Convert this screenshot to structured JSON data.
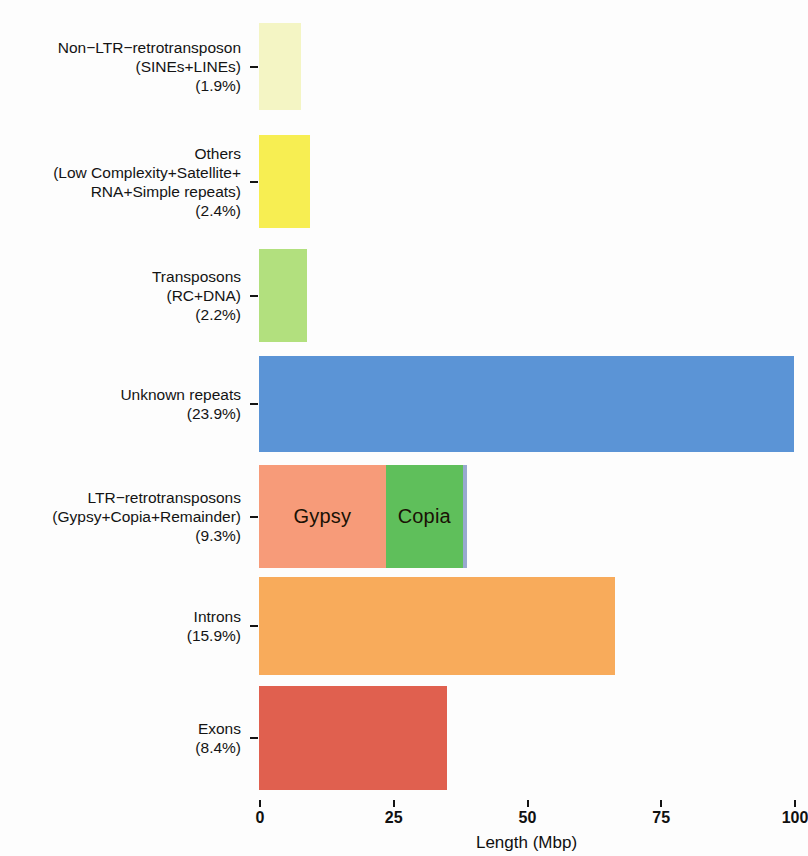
{
  "chart_data": {
    "type": "bar",
    "orientation": "horizontal",
    "stacked": true,
    "title": "",
    "xlabel": "Length (Mbp)",
    "ylabel": "",
    "xlim": [
      0,
      100
    ],
    "xticks": [
      0,
      25,
      50,
      75,
      100
    ],
    "xtick_labels": [
      "0",
      "25",
      "50",
      "75",
      "100"
    ],
    "grid": false,
    "legend": "none",
    "categories": [
      "Non−LTR−retrotransposon\n(SINEs+LINEs)\n(1.9%)",
      "Others\n(Low Complexity+Satellite+\nRNA+Simple repeats)\n(2.4%)",
      "Transposons\n(RC+DNA)\n(2.2%)",
      "Unknown repeats\n(23.9%)",
      "LTR−retrotransposons\n(Gypsy+Copia+Remainder)\n(9.3%)",
      "Introns\n(15.9%)",
      "Exons\n(8.4%)"
    ],
    "values": [
      7.9,
      9.5,
      9.0,
      100.0,
      38.9,
      66.5,
      35.1
    ],
    "percent_labels": [
      "1.9%",
      "2.4%",
      "2.2%",
      "23.9%",
      "9.3%",
      "15.9%",
      "8.4%"
    ],
    "bars": [
      {
        "name": "Non-LTR-retrotransposon",
        "label_lines": [
          "Non−LTR−retrotransposon",
          "(SINEs+LINEs)",
          "(1.9%)"
        ],
        "percent": "1.9%",
        "total": 7.9,
        "segments": [
          {
            "name": "Non-LTR-retrotransposon",
            "value": 7.9,
            "color": "#f4f5c4",
            "label": ""
          }
        ]
      },
      {
        "name": "Others",
        "label_lines": [
          "Others",
          "(Low Complexity+Satellite+",
          "RNA+Simple repeats)",
          "(2.4%)"
        ],
        "percent": "2.4%",
        "total": 9.5,
        "segments": [
          {
            "name": "Others",
            "value": 9.5,
            "color": "#f7ee52",
            "label": ""
          }
        ]
      },
      {
        "name": "Transposons",
        "label_lines": [
          "Transposons",
          "(RC+DNA)",
          "(2.2%)"
        ],
        "percent": "2.2%",
        "total": 9.0,
        "segments": [
          {
            "name": "Transposons",
            "value": 9.0,
            "color": "#b2e07e",
            "label": ""
          }
        ]
      },
      {
        "name": "Unknown repeats",
        "label_lines": [
          "Unknown repeats",
          "(23.9%)"
        ],
        "percent": "23.9%",
        "total": 100.0,
        "segments": [
          {
            "name": "Unknown repeats",
            "value": 100.0,
            "color": "#5b94d6",
            "label": ""
          }
        ]
      },
      {
        "name": "LTR-retrotransposons",
        "label_lines": [
          "LTR−retrotransposons",
          "(Gypsy+Copia+Remainder)",
          "(9.3%)"
        ],
        "percent": "9.3%",
        "total": 38.9,
        "segments": [
          {
            "name": "Gypsy",
            "value": 23.7,
            "color": "#f79b79",
            "label": "Gypsy"
          },
          {
            "name": "Copia",
            "value": 14.4,
            "color": "#5fbf5b",
            "label": "Copia"
          },
          {
            "name": "Remainder",
            "value": 0.8,
            "color": "#98a9cf",
            "label": ""
          }
        ]
      },
      {
        "name": "Introns",
        "label_lines": [
          "Introns",
          "(15.9%)"
        ],
        "percent": "15.9%",
        "total": 66.5,
        "segments": [
          {
            "name": "Introns",
            "value": 66.5,
            "color": "#f8ab5b",
            "label": ""
          }
        ]
      },
      {
        "name": "Exons",
        "label_lines": [
          "Exons",
          "(8.4%)"
        ],
        "percent": "8.4%",
        "total": 35.1,
        "segments": [
          {
            "name": "Exons",
            "value": 35.1,
            "color": "#e0604f",
            "label": ""
          }
        ]
      }
    ]
  },
  "axis": {
    "x_title": "Length (Mbp)",
    "ticks": [
      "0",
      "25",
      "50",
      "75",
      "100"
    ]
  }
}
